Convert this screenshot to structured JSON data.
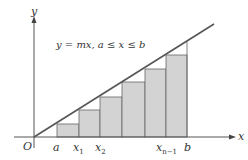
{
  "diagram": {
    "equation": "y = mx, a ≤ x ≤ b",
    "axes": {
      "x_label": "x",
      "y_label": "y",
      "origin_label": "O"
    },
    "tick_labels": {
      "a": "a",
      "x1": "x",
      "x1_sub": "1",
      "x2": "x",
      "x2_sub": "2",
      "xn1": "x",
      "xn1_sub": "n−1",
      "b": "b"
    },
    "colors": {
      "line": "#555555",
      "bar_fill": "#d3d3d3",
      "bar_stroke": "#666666",
      "axis": "#555555"
    }
  }
}
